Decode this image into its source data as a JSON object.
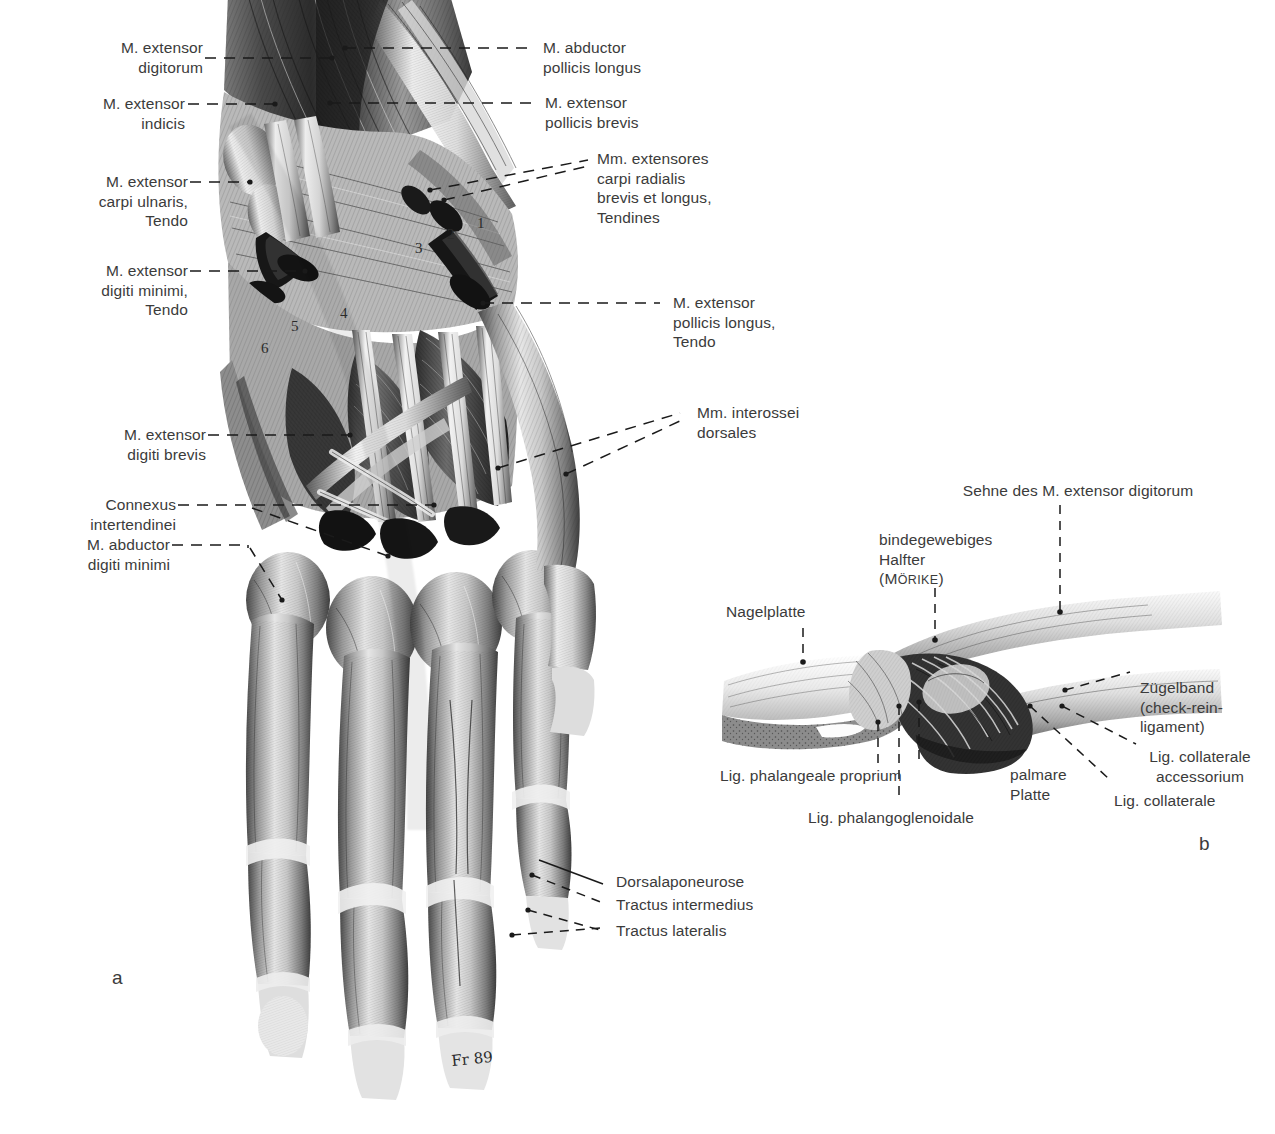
{
  "figure": {
    "type": "anatomical-illustration",
    "language": "de",
    "background_color": "#ffffff",
    "text_color": "#3b3b3b",
    "panel_labels": {
      "a": "a",
      "b": "b"
    },
    "artist_signature": "Fr 89"
  },
  "panel_a": {
    "labels_left": [
      {
        "id": "extensor-digitorum",
        "text": "M. extensor\ndigitorum"
      },
      {
        "id": "extensor-indicis",
        "text": "M. extensor\nindicis"
      },
      {
        "id": "extensor-carpi-ulnaris-tendo",
        "text": "M. extensor\ncarpi ulnaris,\nTendo"
      },
      {
        "id": "extensor-digiti-minimi-tendo",
        "text": "M. extensor\ndigiti minimi,\nTendo"
      },
      {
        "id": "extensor-digiti-brevis",
        "text": "M. extensor\ndigiti brevis"
      },
      {
        "id": "connexus-intertendinei",
        "text": "Connexus\nintertendinei"
      },
      {
        "id": "abductor-digiti-minimi",
        "text": "M. abductor\ndigiti minimi"
      }
    ],
    "labels_right": [
      {
        "id": "abductor-pollicis-longus",
        "text": "M. abductor\npollicis longus"
      },
      {
        "id": "extensor-pollicis-brevis",
        "text": "M. extensor\npollicis brevis"
      },
      {
        "id": "extensores-carpi-radialis",
        "text": "Mm. extensores\ncarpi radialis\nbrevis et longus,\nTendines"
      },
      {
        "id": "extensor-pollicis-longus-tendo",
        "text": "M. extensor\npollicis longus,\nTendo"
      },
      {
        "id": "interossei-dorsales",
        "text": "Mm. interossei\ndorsales"
      },
      {
        "id": "dorsalaponeurose",
        "text": "Dorsalaponeurose"
      },
      {
        "id": "tractus-intermedius",
        "text": "Tractus intermedius"
      },
      {
        "id": "tractus-lateralis",
        "text": "Tractus lateralis"
      }
    ],
    "numbered_markers": [
      {
        "id": "marker-1",
        "text": "1"
      },
      {
        "id": "marker-2",
        "text": "2"
      },
      {
        "id": "marker-3",
        "text": "3"
      },
      {
        "id": "marker-4",
        "text": "4"
      },
      {
        "id": "marker-5",
        "text": "5"
      },
      {
        "id": "marker-6",
        "text": "6"
      }
    ]
  },
  "panel_b": {
    "labels": [
      {
        "id": "sehne-extensor-digitorum",
        "text": "Sehne des M. extensor digitorum"
      },
      {
        "id": "bindegewebiges-halfter",
        "text": "bindegewebiges\nHalfter"
      },
      {
        "id": "moerike",
        "text": "(MÖRIKE)"
      },
      {
        "id": "nagelplatte",
        "text": "Nagelplatte"
      },
      {
        "id": "zuegelband",
        "text": "Zügelband\n(check-rein-\nligament)"
      },
      {
        "id": "lig-collaterale-accessorium",
        "text": "Lig. collaterale\naccessorium"
      },
      {
        "id": "lig-collaterale",
        "text": "Lig. collaterale"
      },
      {
        "id": "palmare-platte",
        "text": "palmare\nPlatte"
      },
      {
        "id": "lig-phalangeale-proprium",
        "text": "Lig. phalangeale proprium"
      },
      {
        "id": "lig-phalangoglenoidale",
        "text": "Lig. phalangoglenoidale"
      }
    ]
  }
}
